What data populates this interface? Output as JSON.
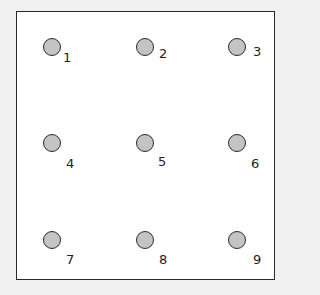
{
  "colors": {
    "background": "#f0f0f0",
    "frame_fill": "#ffffff",
    "frame_border": "#2a2a2a",
    "dot_fill": "#c4c4c4",
    "dot_border": "#2b2b2b",
    "label": "#222222"
  },
  "grid": {
    "rows": 3,
    "cols": 3,
    "points": [
      {
        "label": "1",
        "row": 1,
        "col": 1
      },
      {
        "label": "2",
        "row": 1,
        "col": 2
      },
      {
        "label": "3",
        "row": 1,
        "col": 3
      },
      {
        "label": "4",
        "row": 2,
        "col": 1
      },
      {
        "label": "5",
        "row": 2,
        "col": 2
      },
      {
        "label": "6",
        "row": 2,
        "col": 3
      },
      {
        "label": "7",
        "row": 3,
        "col": 1
      },
      {
        "label": "8",
        "row": 3,
        "col": 2
      },
      {
        "label": "9",
        "row": 3,
        "col": 3
      }
    ]
  }
}
